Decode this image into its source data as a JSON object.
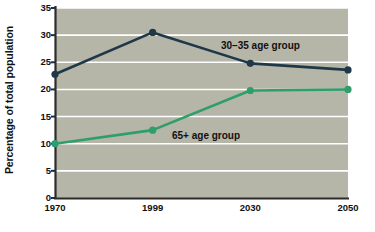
{
  "chart_data": {
    "type": "line",
    "title": "",
    "xlabel": "",
    "ylabel": "Percentage of total population",
    "categories": [
      "1970",
      "1999",
      "2030",
      "2050"
    ],
    "x": [
      "1970",
      "1999",
      "2030",
      "2050"
    ],
    "ylim": [
      0,
      35
    ],
    "yticks": [
      0,
      5,
      10,
      15,
      20,
      25,
      30,
      35
    ],
    "ytick_labels": [
      "0",
      "5",
      "10",
      "15",
      "20",
      "25",
      "30",
      "35"
    ],
    "grid": "horizontal",
    "legend_position": "inline-annotations",
    "series": [
      {
        "name": "30–35 age group",
        "color": "#1e3848",
        "values": [
          22.8,
          30.5,
          24.8,
          23.6
        ],
        "annotation": "30–35 age group"
      },
      {
        "name": "65+ age group",
        "color": "#2e9e6b",
        "values": [
          10.0,
          12.5,
          19.8,
          20.0
        ],
        "annotation": "65+ age group"
      }
    ]
  },
  "style": {
    "plot_background": "#b5b5a8",
    "gridline_color": "#ffffff",
    "axis_color": "#2b2b2b",
    "page_background": "#ffffff",
    "navy": "#1e3848",
    "green": "#2e9e6b"
  }
}
